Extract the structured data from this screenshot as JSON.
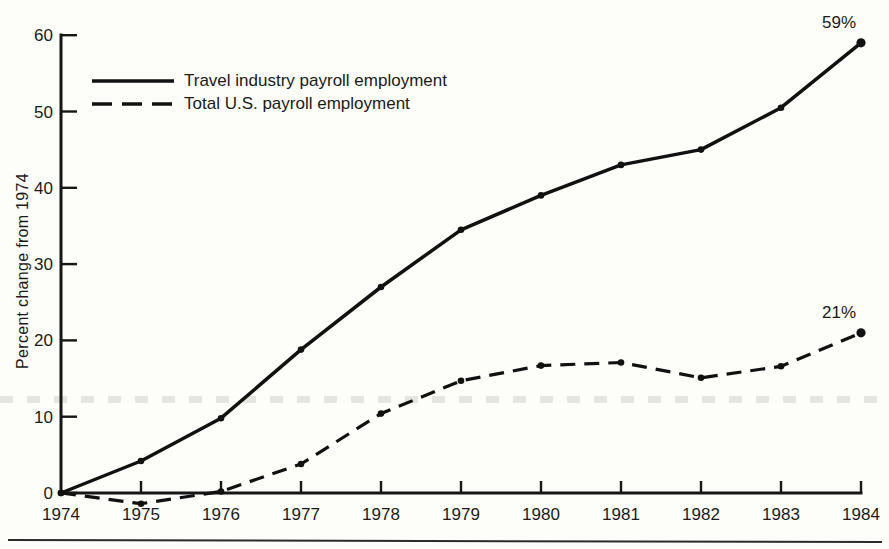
{
  "figure": {
    "background_color": "#fdfdf9",
    "ink_color": "#111111"
  },
  "chart_data": {
    "type": "line",
    "title": "",
    "xlabel": "",
    "ylabel": "Percent change from 1974",
    "x_years": [
      1974,
      1975,
      1976,
      1977,
      1978,
      1979,
      1980,
      1981,
      1982,
      1983,
      1984
    ],
    "yticks": [
      0,
      10,
      20,
      30,
      40,
      50,
      60
    ],
    "ylim": [
      -3,
      62
    ],
    "grid": false,
    "legend_position": "upper-left",
    "series": [
      {
        "name": "Travel industry payroll employment",
        "line_style": "solid",
        "values": [
          0,
          4.2,
          9.8,
          18.8,
          27,
          34.5,
          39,
          43,
          45,
          50.5,
          59
        ],
        "end_label": "59%"
      },
      {
        "name": "Total U.S. payroll employment",
        "line_style": "dashed",
        "values": [
          0,
          -1.4,
          0.2,
          3.8,
          10.4,
          14.7,
          16.7,
          17.1,
          15.1,
          16.6,
          21
        ],
        "end_label": "21%"
      }
    ]
  }
}
